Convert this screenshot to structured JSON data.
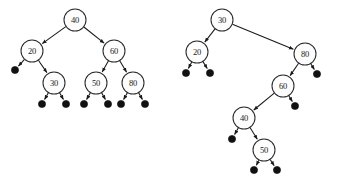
{
  "figure": {
    "background_color": "#ffffff",
    "node_fill_color": "#fdfdfd",
    "node_stroke_color": "#2b2b2b",
    "nil_leaf_color": "#111111",
    "edge_color": "#1a1a1a",
    "node_radius": 11,
    "nil_radius": 3.6
  },
  "chart_data": {
    "type": "diagram",
    "subtype": "binary-search-tree",
    "trees": [
      {
        "name": "left-tree",
        "root": "40",
        "nodes": [
          {
            "id": "L40",
            "label": "40",
            "x": 75,
            "y": 20
          },
          {
            "id": "L20",
            "label": "20",
            "x": 32,
            "y": 51
          },
          {
            "id": "L60",
            "label": "60",
            "x": 114,
            "y": 51
          },
          {
            "id": "L30",
            "label": "30",
            "x": 54,
            "y": 83
          },
          {
            "id": "L50",
            "label": "50",
            "x": 96,
            "y": 83
          },
          {
            "id": "L80",
            "label": "80",
            "x": 133,
            "y": 83
          }
        ],
        "nil_leaves": [
          {
            "id": "Ln1",
            "x": 15,
            "y": 70
          },
          {
            "id": "Ln2",
            "x": 42,
            "y": 104
          },
          {
            "id": "Ln3",
            "x": 66,
            "y": 104
          },
          {
            "id": "Ln4",
            "x": 84,
            "y": 104
          },
          {
            "id": "Ln5",
            "x": 108,
            "y": 104
          },
          {
            "id": "Ln6",
            "x": 121,
            "y": 104
          },
          {
            "id": "Ln7",
            "x": 145,
            "y": 104
          }
        ],
        "edges": [
          {
            "from": "L40",
            "to": "L20"
          },
          {
            "from": "L40",
            "to": "L60"
          },
          {
            "from": "L20",
            "to": "Ln1"
          },
          {
            "from": "L20",
            "to": "L30"
          },
          {
            "from": "L30",
            "to": "Ln2"
          },
          {
            "from": "L30",
            "to": "Ln3"
          },
          {
            "from": "L60",
            "to": "L50"
          },
          {
            "from": "L60",
            "to": "L80"
          },
          {
            "from": "L50",
            "to": "Ln4"
          },
          {
            "from": "L50",
            "to": "Ln5"
          },
          {
            "from": "L80",
            "to": "Ln6"
          },
          {
            "from": "L80",
            "to": "Ln7"
          }
        ]
      },
      {
        "name": "right-tree",
        "root": "30",
        "nodes": [
          {
            "id": "R30",
            "label": "30",
            "x": 222,
            "y": 20
          },
          {
            "id": "R20",
            "label": "20",
            "x": 197,
            "y": 52
          },
          {
            "id": "R80",
            "label": "80",
            "x": 305,
            "y": 54
          },
          {
            "id": "R60",
            "label": "60",
            "x": 283,
            "y": 86
          },
          {
            "id": "R40",
            "label": "40",
            "x": 244,
            "y": 118
          },
          {
            "id": "R50",
            "label": "50",
            "x": 264,
            "y": 150
          }
        ],
        "nil_leaves": [
          {
            "id": "Rn1",
            "x": 186,
            "y": 73
          },
          {
            "id": "Rn2",
            "x": 210,
            "y": 73
          },
          {
            "id": "Rn3",
            "x": 317,
            "y": 74
          },
          {
            "id": "Rn4",
            "x": 295,
            "y": 106
          },
          {
            "id": "Rn5",
            "x": 232,
            "y": 139
          },
          {
            "id": "Rn6",
            "x": 254,
            "y": 170
          },
          {
            "id": "Rn7",
            "x": 277,
            "y": 170
          }
        ],
        "edges": [
          {
            "from": "R30",
            "to": "R20"
          },
          {
            "from": "R30",
            "to": "R80"
          },
          {
            "from": "R20",
            "to": "Rn1"
          },
          {
            "from": "R20",
            "to": "Rn2"
          },
          {
            "from": "R80",
            "to": "R60"
          },
          {
            "from": "R80",
            "to": "Rn3"
          },
          {
            "from": "R60",
            "to": "R40"
          },
          {
            "from": "R60",
            "to": "Rn4"
          },
          {
            "from": "R40",
            "to": "Rn5"
          },
          {
            "from": "R40",
            "to": "R50"
          },
          {
            "from": "R50",
            "to": "Rn6"
          },
          {
            "from": "R50",
            "to": "Rn7"
          }
        ]
      }
    ]
  }
}
